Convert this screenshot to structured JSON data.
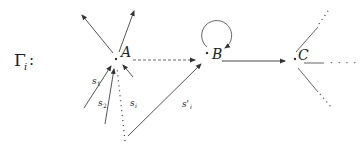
{
  "diagram": {
    "graph_label": {
      "base": "Γ",
      "sub": "i",
      "suffix": ":"
    },
    "nodes": [
      {
        "id": "A",
        "label": "A"
      },
      {
        "id": "B",
        "label": "B"
      },
      {
        "id": "C",
        "label": "C"
      }
    ],
    "edge_labels": {
      "s1": {
        "base": "s",
        "sub": "1"
      },
      "s2": {
        "base": "s",
        "sub": "2"
      },
      "si": {
        "base": "s",
        "sub": "i"
      },
      "spi": {
        "base": "s'",
        "sub": "i"
      }
    },
    "ellipsis": "· · · ·",
    "colors": {
      "line": "#555555",
      "text": "#222222",
      "background": "#ffffff"
    }
  }
}
